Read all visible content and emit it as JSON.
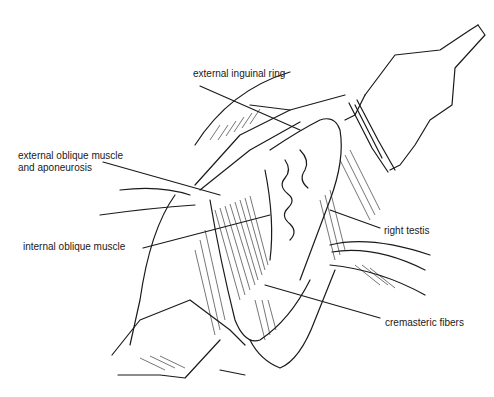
{
  "figure": {
    "labels": [
      {
        "id": "external-inguinal-ring",
        "text": "external inguinal ring",
        "x": 193,
        "y": 68
      },
      {
        "id": "external-oblique",
        "text": "external oblique muscle",
        "text2": "and aponeurosis",
        "x": 18,
        "y": 150
      },
      {
        "id": "internal-oblique",
        "text": "internal oblique muscle",
        "x": 23,
        "y": 241
      },
      {
        "id": "right-testis",
        "text": "right testis",
        "x": 384,
        "y": 225
      },
      {
        "id": "cremasteric-fibers",
        "text": "cremasteric fibers",
        "x": 385,
        "y": 317
      }
    ],
    "colors": {
      "ink": "#1a1a1a",
      "background": "#ffffff"
    }
  }
}
